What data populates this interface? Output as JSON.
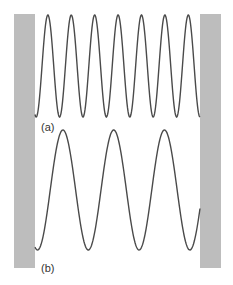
{
  "figure": {
    "labels": {
      "a": "(a)",
      "b": "(b)"
    },
    "colors": {
      "wall": "#bdbdbd",
      "wave": "#4a4a4a",
      "label": "#333333",
      "background": "#ffffff"
    },
    "walls": {
      "left": {
        "x": 14,
        "y": 14,
        "width": 21,
        "height": 254
      },
      "right": {
        "x": 200,
        "y": 14,
        "width": 21,
        "height": 254
      }
    },
    "waves": [
      {
        "id": "a",
        "peaks": 7,
        "x_start": 35,
        "x_end": 200,
        "y_peak": 15,
        "y_trough": 117
      },
      {
        "id": "b",
        "peaks": 3,
        "x_start": 35,
        "x_end": 200,
        "y_peak": 130,
        "y_trough": 250
      }
    ]
  }
}
